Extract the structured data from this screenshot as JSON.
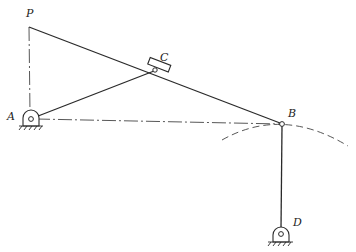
{
  "diagram": {
    "type": "planar-linkage-mechanism",
    "points": {
      "P": {
        "label": "P",
        "x": 29,
        "y": 27
      },
      "A": {
        "label": "A",
        "x": 31,
        "y": 119
      },
      "C": {
        "label": "C",
        "x": 155,
        "y": 70
      },
      "B": {
        "label": "B",
        "x": 282,
        "y": 124
      },
      "D": {
        "label": "D",
        "x": 281,
        "y": 234
      }
    },
    "links": [
      {
        "from": "P",
        "to": "B",
        "style": "solid"
      },
      {
        "from": "A",
        "to": "C",
        "style": "solid"
      },
      {
        "from": "B",
        "to": "D",
        "style": "solid"
      }
    ],
    "construction_lines": [
      {
        "from": "P",
        "to": "A",
        "style": "dash-dot"
      },
      {
        "from": "A",
        "to": "B",
        "style": "dash-dot"
      }
    ],
    "arcs": [
      {
        "through": "B",
        "center": "D",
        "style": "dashed"
      }
    ],
    "supports": [
      "A",
      "D"
    ],
    "slider": {
      "at": "C",
      "on_link": "PB"
    },
    "stroke_color": "#2a2a2a"
  }
}
